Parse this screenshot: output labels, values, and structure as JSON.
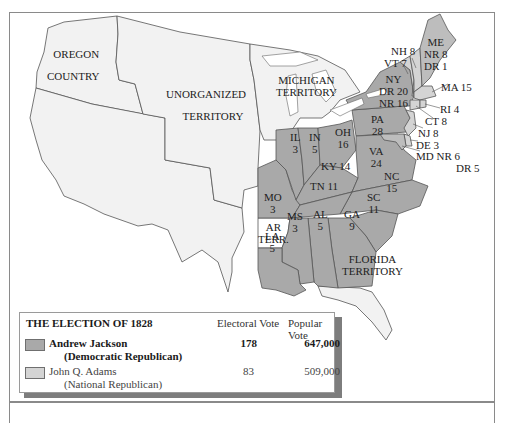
{
  "colors": {
    "jackson_fill": "#a9a9a9",
    "adams_fill": "#d4d4d4",
    "territory_fill": "#f2f2f2",
    "unassigned_fill": "#ffffff",
    "border": "#555555"
  },
  "territories": {
    "oregon": [
      "OREGON",
      "COUNTRY"
    ],
    "unorganized": [
      "UNORGANIZED",
      "TERRITORY"
    ],
    "michigan": [
      "MICHIGAN",
      "TERRITORY"
    ],
    "arkansas": [
      "AR",
      "TERR."
    ],
    "florida": [
      "FLORIDA",
      "TERRITORY"
    ]
  },
  "states": [
    {
      "abbr": "MO",
      "votes": "3",
      "winner": "Jackson"
    },
    {
      "abbr": "IL",
      "votes": "3",
      "winner": "Jackson"
    },
    {
      "abbr": "IN",
      "votes": "5",
      "winner": "Jackson"
    },
    {
      "abbr": "OH",
      "votes": "16",
      "winner": "Jackson"
    },
    {
      "abbr": "KY",
      "votes": "14",
      "winner": "Jackson"
    },
    {
      "abbr": "PA",
      "votes": "28",
      "winner": "Jackson"
    },
    {
      "abbr": "VA",
      "votes": "24",
      "winner": "Jackson"
    },
    {
      "abbr": "NC",
      "votes": "15",
      "winner": "Jackson"
    },
    {
      "abbr": "TN",
      "votes": "11",
      "winner": "Jackson"
    },
    {
      "abbr": "SC",
      "votes": "11",
      "winner": "Jackson"
    },
    {
      "abbr": "GA",
      "votes": "9",
      "winner": "Jackson"
    },
    {
      "abbr": "AL",
      "votes": "5",
      "winner": "Jackson"
    },
    {
      "abbr": "MS",
      "votes": "3",
      "winner": "Jackson"
    },
    {
      "abbr": "LA",
      "votes": "5",
      "winner": "Jackson"
    },
    {
      "abbr": "NY",
      "votes": "DR 20 / NR 16",
      "winner": "Split"
    },
    {
      "abbr": "ME",
      "votes": "NR 8 / DR 1",
      "winner": "Split"
    },
    {
      "abbr": "MD",
      "votes": "NR 6 / DR 5",
      "winner": "Split"
    },
    {
      "abbr": "NH",
      "votes": "8",
      "winner": "Adams"
    },
    {
      "abbr": "VT",
      "votes": "7",
      "winner": "Adams"
    },
    {
      "abbr": "MA",
      "votes": "15",
      "winner": "Adams"
    },
    {
      "abbr": "RI",
      "votes": "4",
      "winner": "Adams"
    },
    {
      "abbr": "CT",
      "votes": "8",
      "winner": "Adams"
    },
    {
      "abbr": "NJ",
      "votes": "8",
      "winner": "Adams"
    },
    {
      "abbr": "DE",
      "votes": "3",
      "winner": "Adams"
    }
  ],
  "labels": {
    "MO": [
      "MO",
      "3"
    ],
    "IL": [
      "IL",
      "3"
    ],
    "IN": [
      "IN",
      "5"
    ],
    "OH": [
      "OH",
      "16"
    ],
    "KY": "KY 14",
    "PA": [
      "PA",
      "28"
    ],
    "VA": [
      "VA",
      "24"
    ],
    "NC": [
      "NC",
      "15"
    ],
    "TN": "TN 11",
    "SC": [
      "SC",
      "11"
    ],
    "GA": [
      "GA",
      "9"
    ],
    "AL": [
      "AL",
      "5"
    ],
    "MS": [
      "MS",
      "3"
    ],
    "LA": [
      "LA",
      "5"
    ],
    "NY": [
      "NY",
      "DR 20",
      "NR 16"
    ],
    "ME": [
      "ME",
      "NR 8",
      "DR 1"
    ],
    "NH": "NH 8",
    "VT": "VT 7",
    "MA": "MA 15",
    "RI": "RI 4",
    "CT": "CT 8",
    "NJ": "NJ 8",
    "DE": "DE 3",
    "MD": [
      "MD  NR 6",
      "DR 5"
    ]
  },
  "legend": {
    "title": "THE ELECTION OF 1828",
    "col_electoral": "Electoral Vote",
    "col_popular": "Popular Vote",
    "candidates": [
      {
        "name": "Andrew Jackson",
        "party": "(Democratic Republican)",
        "electoral": "178",
        "popular": "647,000",
        "bold": true
      },
      {
        "name": "John Q. Adams",
        "party": "(National Republican)",
        "electoral": "83",
        "popular": "509,000",
        "bold": false
      }
    ]
  }
}
